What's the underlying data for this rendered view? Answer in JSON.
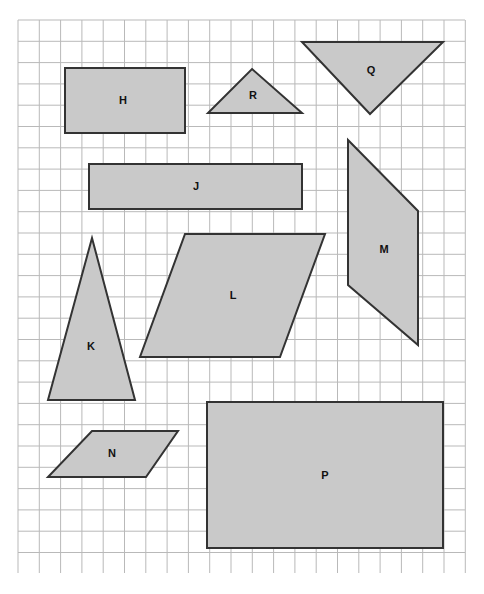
{
  "worksheet": {
    "title": "Geometric shapes on grid",
    "background_color": "#ffffff",
    "grid": {
      "line_color": "#b9b9b9",
      "cell_size": 21.3,
      "origin_x": 18,
      "origin_y": 20,
      "columns": 21,
      "rows": 26,
      "right_edge": 465,
      "bottom_edge": 573
    },
    "shape_style": {
      "fill_color": "#c9c9c9",
      "stroke_color": "#333333",
      "stroke_width": 2,
      "label_color": "#111111"
    }
  },
  "shapes": [
    {
      "label": "H",
      "type": "rectangle",
      "points": "65,68 185,68 185,133 65,133",
      "label_x": 123,
      "label_y": 101
    },
    {
      "label": "R",
      "type": "triangle",
      "points": "252,69 302,113 208,113",
      "label_x": 253,
      "label_y": 96
    },
    {
      "label": "Q",
      "type": "triangle",
      "points": "302,42 443,42 370,114",
      "label_x": 371,
      "label_y": 71
    },
    {
      "label": "J",
      "type": "rectangle",
      "points": "89,164 302,164 302,209 89,209",
      "label_x": 196,
      "label_y": 187
    },
    {
      "label": "M",
      "type": "quadrilateral",
      "points": "348,140 418,211 418,345 348,285",
      "label_x": 384,
      "label_y": 250
    },
    {
      "label": "L",
      "type": "parallelogram",
      "points": "185,234 325,234 280,357 140,357",
      "label_x": 233,
      "label_y": 296
    },
    {
      "label": "K",
      "type": "triangle",
      "points": "92,238 135,400 48,400",
      "label_x": 91,
      "label_y": 347
    },
    {
      "label": "N",
      "type": "parallelogram",
      "points": "92,431 178,431 146,477 48,477",
      "label_x": 112,
      "label_y": 454
    },
    {
      "label": "P",
      "type": "rectangle",
      "points": "207,402 443,402 443,548 207,548",
      "label_x": 325,
      "label_y": 476
    }
  ]
}
